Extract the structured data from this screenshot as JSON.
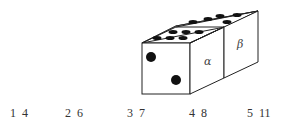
{
  "diagram": {
    "labels": {
      "alpha": "α",
      "beta": "β"
    },
    "front_face_pips": 2,
    "top_face_left_pips": 6,
    "top_face_right_pips": 5,
    "stroke_color": "#222222",
    "pip_color": "#111111"
  },
  "options": [
    {
      "a": "1",
      "b": "4"
    },
    {
      "a": "2",
      "b": "6"
    },
    {
      "a": "3",
      "b": "7"
    },
    {
      "a": "4",
      "b": "8"
    },
    {
      "a": "5",
      "b": "11"
    }
  ]
}
